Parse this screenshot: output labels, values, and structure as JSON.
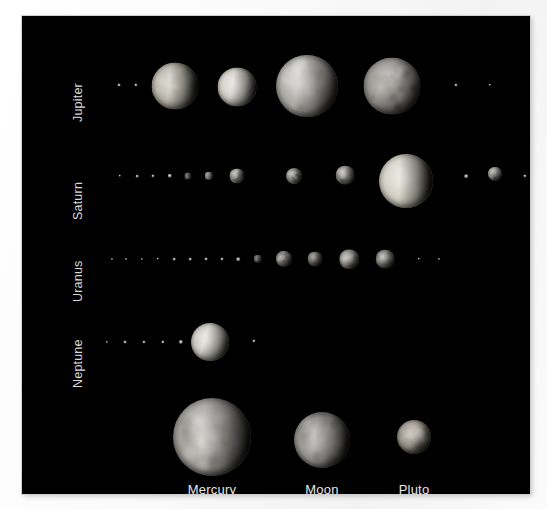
{
  "figure": {
    "background_color": "#ffffff",
    "plate_color": "#000000",
    "label_color": "#d9d9d9",
    "caption_color": "#e6e6e6"
  },
  "rows": [
    {
      "id": "jupiter",
      "label": "Jupiter"
    },
    {
      "id": "saturn",
      "label": "Saturn"
    },
    {
      "id": "uranus",
      "label": "Uranus"
    },
    {
      "id": "neptune",
      "label": "Neptune"
    }
  ],
  "reference_row": {
    "items": [
      {
        "id": "mercury",
        "label": "Mercury"
      },
      {
        "id": "moon",
        "label": "Moon"
      },
      {
        "id": "pluto",
        "label": "Pluto"
      }
    ]
  },
  "chart_data": {
    "type": "scatter",
    "title": "",
    "xlabel": "",
    "ylabel": "",
    "grid": false,
    "legend": false,
    "rows": [
      {
        "name": "Jupiter",
        "label_x": 63,
        "label_y": 92,
        "bodies": [
          {
            "cx": 97,
            "cy": 69,
            "r": 1.4,
            "style": "speck",
            "tone": "dim"
          },
          {
            "cx": 114,
            "cy": 69,
            "r": 1.6,
            "style": "speck",
            "tone": "dim"
          },
          {
            "cx": 153,
            "cy": 70,
            "r": 23.5,
            "style": "disc",
            "tone": "io",
            "texture": "mottled",
            "phase": 96
          },
          {
            "cx": 215,
            "cy": 71,
            "r": 19.5,
            "style": "disc",
            "tone": "europa",
            "texture": "smooth",
            "phase": 100
          },
          {
            "cx": 285,
            "cy": 70,
            "r": 31.0,
            "style": "disc",
            "tone": "ganymede",
            "texture": "blotchy",
            "phase": 104
          },
          {
            "cx": 370,
            "cy": 70,
            "r": 28.5,
            "style": "disc",
            "tone": "callisto",
            "texture": "cratered",
            "phase": 118
          },
          {
            "cx": 434,
            "cy": 69,
            "r": 1.5,
            "style": "speck",
            "tone": "dim"
          },
          {
            "cx": 468,
            "cy": 69,
            "r": 1.2,
            "style": "speck",
            "tone": "dim"
          }
        ]
      },
      {
        "name": "Saturn",
        "label_x": 63,
        "label_y": 190,
        "bodies": [
          {
            "cx": 98,
            "cy": 160,
            "r": 1.2,
            "style": "speck",
            "tone": "dim"
          },
          {
            "cx": 115,
            "cy": 160,
            "r": 1.3,
            "style": "speck",
            "tone": "dim"
          },
          {
            "cx": 131,
            "cy": 160,
            "r": 1.6,
            "style": "speck",
            "tone": "dim"
          },
          {
            "cx": 148,
            "cy": 160,
            "r": 2.2,
            "style": "speck",
            "tone": "pale"
          },
          {
            "cx": 166,
            "cy": 160,
            "r": 3.6,
            "style": "disc",
            "tone": "mimas",
            "texture": "cratered",
            "phase": 100
          },
          {
            "cx": 187,
            "cy": 160,
            "r": 4.2,
            "style": "disc",
            "tone": "enceladus",
            "texture": "smooth",
            "phase": 100
          },
          {
            "cx": 215,
            "cy": 160,
            "r": 7.6,
            "style": "disc",
            "tone": "tethys",
            "texture": "mottled",
            "phase": 108
          },
          {
            "cx": 272,
            "cy": 160,
            "r": 8.0,
            "style": "disc",
            "tone": "dione",
            "texture": "cratered",
            "phase": 110
          },
          {
            "cx": 323,
            "cy": 159,
            "r": 9.4,
            "style": "disc",
            "tone": "rhea",
            "texture": "blotchy",
            "phase": 112
          },
          {
            "cx": 384,
            "cy": 165,
            "r": 27.0,
            "style": "disc",
            "tone": "titan",
            "texture": "hazy",
            "phase": 92
          },
          {
            "cx": 444,
            "cy": 160,
            "r": 1.8,
            "style": "speck",
            "tone": "pale"
          },
          {
            "cx": 473,
            "cy": 158,
            "r": 7.2,
            "style": "disc",
            "tone": "iapetus",
            "texture": "mottled",
            "phase": 126
          },
          {
            "cx": 503,
            "cy": 160,
            "r": 1.6,
            "style": "speck",
            "tone": "dim"
          }
        ]
      },
      {
        "name": "Uranus",
        "label_x": 63,
        "label_y": 272,
        "bodies": [
          {
            "cx": 90,
            "cy": 243,
            "r": 1.0,
            "style": "speck",
            "tone": "faint"
          },
          {
            "cx": 104,
            "cy": 243,
            "r": 1.0,
            "style": "speck",
            "tone": "faint"
          },
          {
            "cx": 120,
            "cy": 243,
            "r": 1.1,
            "style": "speck",
            "tone": "faint"
          },
          {
            "cx": 136,
            "cy": 243,
            "r": 1.2,
            "style": "speck",
            "tone": "faint"
          },
          {
            "cx": 152,
            "cy": 243,
            "r": 1.3,
            "style": "speck",
            "tone": "faint"
          },
          {
            "cx": 168,
            "cy": 243,
            "r": 1.3,
            "style": "speck",
            "tone": "faint"
          },
          {
            "cx": 184,
            "cy": 243,
            "r": 1.4,
            "style": "speck",
            "tone": "faint"
          },
          {
            "cx": 200,
            "cy": 243,
            "r": 1.5,
            "style": "speck",
            "tone": "faint"
          },
          {
            "cx": 216,
            "cy": 243,
            "r": 1.8,
            "style": "speck",
            "tone": "dim"
          },
          {
            "cx": 236,
            "cy": 243,
            "r": 4.2,
            "style": "disc",
            "tone": "miranda",
            "texture": "cratered",
            "phase": 112
          },
          {
            "cx": 262,
            "cy": 243,
            "r": 8.2,
            "style": "disc",
            "tone": "ariel",
            "texture": "mottled",
            "phase": 116
          },
          {
            "cx": 293,
            "cy": 243,
            "r": 7.6,
            "style": "disc",
            "tone": "umbriel",
            "texture": "smooth",
            "phase": 120
          },
          {
            "cx": 327,
            "cy": 243,
            "r": 9.8,
            "style": "disc",
            "tone": "titania",
            "texture": "blotchy",
            "phase": 122
          },
          {
            "cx": 363,
            "cy": 243,
            "r": 9.4,
            "style": "disc",
            "tone": "oberon",
            "texture": "cratered",
            "phase": 124
          },
          {
            "cx": 397,
            "cy": 243,
            "r": 1.2,
            "style": "speck",
            "tone": "faint"
          },
          {
            "cx": 417,
            "cy": 243,
            "r": 1.0,
            "style": "speck",
            "tone": "faint"
          }
        ]
      },
      {
        "name": "Neptune",
        "label_x": 63,
        "label_y": 358,
        "bodies": [
          {
            "cx": 85,
            "cy": 326,
            "r": 1.1,
            "style": "speck",
            "tone": "faint"
          },
          {
            "cx": 103,
            "cy": 326,
            "r": 1.4,
            "style": "speck",
            "tone": "dim"
          },
          {
            "cx": 122,
            "cy": 326,
            "r": 1.5,
            "style": "speck",
            "tone": "dim"
          },
          {
            "cx": 141,
            "cy": 326,
            "r": 1.6,
            "style": "speck",
            "tone": "dim"
          },
          {
            "cx": 159,
            "cy": 326,
            "r": 2.1,
            "style": "speck",
            "tone": "pale"
          },
          {
            "cx": 188,
            "cy": 326,
            "r": 19.0,
            "style": "disc",
            "tone": "triton",
            "texture": "smooth",
            "phase": 108
          },
          {
            "cx": 232,
            "cy": 325,
            "r": 1.6,
            "style": "speck",
            "tone": "pale"
          }
        ]
      }
    ],
    "reference_bodies": [
      {
        "name": "Mercury",
        "cx": 190,
        "cy": 421,
        "r": 39.0,
        "label_x": 190,
        "label_y": 466,
        "tone": "mercury",
        "texture": "cratered",
        "phase": 96
      },
      {
        "name": "Moon",
        "cx": 300,
        "cy": 424,
        "r": 28.0,
        "label_x": 300,
        "label_y": 466,
        "tone": "luna",
        "texture": "maria",
        "phase": 98
      },
      {
        "name": "Pluto",
        "cx": 392,
        "cy": 421,
        "r": 17.0,
        "label_x": 392,
        "label_y": 466,
        "tone": "pluto",
        "texture": "patchy",
        "phase": 128
      }
    ]
  }
}
